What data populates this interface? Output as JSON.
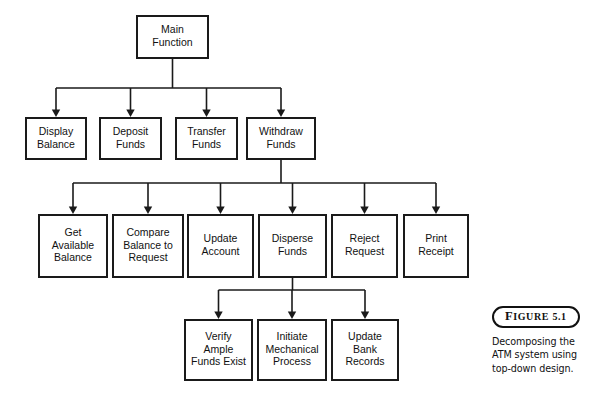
{
  "diagram": {
    "type": "tree",
    "title": "Decomposing the ATM system using top-down design.",
    "nodes": [
      {
        "id": "main",
        "label_line1": "Main",
        "label_line2": "Function",
        "label_line3": "",
        "x": 137,
        "y": 16,
        "w": 71,
        "h": 42,
        "level": 0
      },
      {
        "id": "display",
        "label_line1": "Display",
        "label_line2": "Balance",
        "label_line3": "",
        "x": 26,
        "y": 118,
        "w": 60,
        "h": 41,
        "level": 1
      },
      {
        "id": "deposit",
        "label_line1": "Deposit",
        "label_line2": "Funds",
        "label_line3": "",
        "x": 100,
        "y": 118,
        "w": 61,
        "h": 41,
        "level": 1
      },
      {
        "id": "transfer",
        "label_line1": "Transfer",
        "label_line2": "Funds",
        "label_line3": "",
        "x": 176,
        "y": 118,
        "w": 61,
        "h": 41,
        "level": 1
      },
      {
        "id": "withdraw",
        "label_line1": "Withdraw",
        "label_line2": "Funds",
        "label_line3": "",
        "x": 247,
        "y": 118,
        "w": 68,
        "h": 41,
        "level": 1
      },
      {
        "id": "get_available",
        "label_line1": "Get",
        "label_line2": "Available",
        "label_line3": "Balance",
        "x": 39,
        "y": 215,
        "w": 68,
        "h": 62,
        "level": 2
      },
      {
        "id": "compare",
        "label_line1": "Compare",
        "label_line2": "Balance to",
        "label_line3": "Request",
        "x": 113,
        "y": 215,
        "w": 70,
        "h": 62,
        "level": 2
      },
      {
        "id": "update_account",
        "label_line1": "Update",
        "label_line2": "Account",
        "label_line3": "",
        "x": 188,
        "y": 215,
        "w": 65,
        "h": 62,
        "level": 2
      },
      {
        "id": "disperse",
        "label_line1": "Disperse",
        "label_line2": "Funds",
        "label_line3": "",
        "x": 259,
        "y": 215,
        "w": 67,
        "h": 62,
        "level": 2
      },
      {
        "id": "reject",
        "label_line1": "Reject",
        "label_line2": "Request",
        "label_line3": "",
        "x": 332,
        "y": 215,
        "w": 65,
        "h": 62,
        "level": 2
      },
      {
        "id": "print_receipt",
        "label_line1": "Print",
        "label_line2": "Receipt",
        "label_line3": "",
        "x": 404,
        "y": 215,
        "w": 64,
        "h": 62,
        "level": 2
      },
      {
        "id": "verify_ample",
        "label_line1": "Verify",
        "label_line2": "Ample",
        "label_line3": "Funds Exist",
        "x": 185,
        "y": 320,
        "w": 67,
        "h": 60,
        "level": 3
      },
      {
        "id": "initiate_mech",
        "label_line1": "Initiate",
        "label_line2": "Mechanical",
        "label_line3": "Process",
        "x": 258,
        "y": 320,
        "w": 68,
        "h": 60,
        "level": 3
      },
      {
        "id": "update_bank",
        "label_line1": "Update",
        "label_line2": "Bank",
        "label_line3": "Records",
        "x": 332,
        "y": 320,
        "w": 66,
        "h": 60,
        "level": 3
      }
    ],
    "edge_groups": [
      {
        "id": "main-children",
        "parent": "main",
        "bus_y": 88,
        "stem_from_y": 58,
        "children": [
          "display",
          "deposit",
          "transfer",
          "withdraw"
        ]
      },
      {
        "id": "withdraw-children",
        "parent": "withdraw",
        "bus_y": 183,
        "stem_from_y": 159,
        "children": [
          "get_available",
          "compare",
          "update_account",
          "disperse",
          "reject",
          "print_receipt"
        ]
      },
      {
        "id": "disperse-children",
        "parent": "disperse",
        "bus_y": 290,
        "stem_from_y": 277,
        "children": [
          "verify_ample",
          "initiate_mech",
          "update_bank"
        ]
      }
    ]
  },
  "figure": {
    "label_prefix": "F",
    "label_rest": "IGURE",
    "label_number": "5.1",
    "caption_line1": "Decomposing the",
    "caption_line2": "ATM system using",
    "caption_line3": "top-down design."
  },
  "colors": {
    "box_stroke": "#1a1a1a",
    "box_fill": "#ffffff",
    "text": "#111111",
    "background": "#ffffff"
  }
}
